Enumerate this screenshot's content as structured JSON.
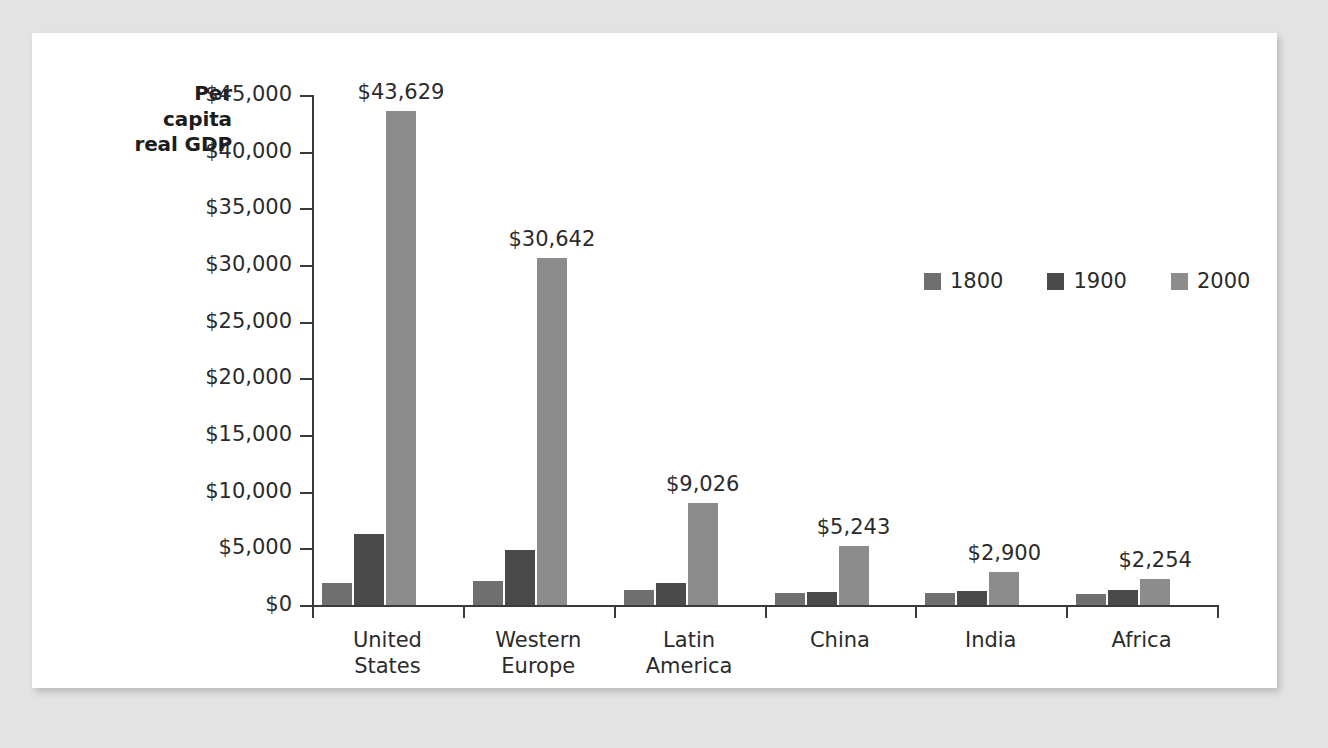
{
  "chart_data": {
    "type": "bar",
    "title": "",
    "subtitle": "",
    "xlabel": "",
    "ylabel": "Per capita real GDP",
    "ylabel_lines": [
      "Per",
      "capita",
      "real GDP"
    ],
    "ylim": [
      0,
      45000
    ],
    "ytick_values": [
      0,
      5000,
      10000,
      15000,
      20000,
      25000,
      30000,
      35000,
      40000,
      45000
    ],
    "ytick_labels": [
      "$0",
      "$5,000",
      "$10,000",
      "$15,000",
      "$20,000",
      "$25,000",
      "$30,000",
      "$35,000",
      "$40,000",
      "$45,000"
    ],
    "grid": false,
    "legend_position": "upper-center-right",
    "categories": [
      "United States",
      "Western Europe",
      "Latin America",
      "China",
      "India",
      "Africa"
    ],
    "category_lines": [
      [
        "United",
        "States"
      ],
      [
        "Western",
        "Europe"
      ],
      [
        "Latin",
        "America"
      ],
      [
        "China"
      ],
      [
        "India"
      ],
      [
        "Africa"
      ]
    ],
    "series": [
      {
        "name": "1800",
        "color": "#6f6f6f",
        "values": [
          1980,
          2090,
          1300,
          1060,
          1100,
          950
        ]
      },
      {
        "name": "1900",
        "color": "#4a4a4a",
        "values": [
          6260,
          4870,
          1980,
          1130,
          1200,
          1330
        ]
      },
      {
        "name": "2000",
        "color": "#8c8c8c",
        "values": [
          43629,
          30642,
          9026,
          5243,
          2900,
          2254
        ]
      }
    ],
    "data_labels": {
      "series": "2000",
      "values": [
        "$43,629",
        "$30,642",
        "$9,026",
        "$5,243",
        "$2,900",
        "$2,254"
      ]
    },
    "colors": {
      "axis": "#3a3a3a",
      "text": "#2b2b2b",
      "panel_background": "#ffffff",
      "page_background": "#e3e3e3"
    }
  },
  "legend": {
    "items": [
      {
        "label": "1800",
        "color": "#6f6f6f"
      },
      {
        "label": "1900",
        "color": "#4a4a4a"
      },
      {
        "label": "2000",
        "color": "#8c8c8c"
      }
    ]
  }
}
